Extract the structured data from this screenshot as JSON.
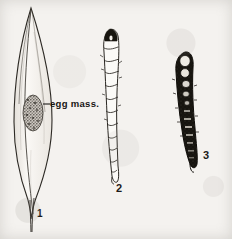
{
  "plate": {
    "background_color": "#f4f2ef",
    "ink_color": "#1d1b19",
    "type": "scientific-line-illustration",
    "caption_labels": {
      "figure_1": "1",
      "figure_2": "2",
      "figure_3": "3"
    },
    "annotations": {
      "egg_mass_label": "egg mass."
    },
    "figures": [
      {
        "number": "1",
        "subject": "leaf-blade-with-egg-mass",
        "description": "Narrow lanceolate leaf blade drawn in outline with midrib, bearing a stippled oval egg mass near mid-blade",
        "annotation": "egg mass.",
        "shading": "outline-with-stipple"
      },
      {
        "number": "2",
        "subject": "pale-segmented-larva",
        "description": "Elongate segmented larva in outline with dark triangular head capsule at top and tapering abdomen",
        "annotation": "",
        "shading": "outline-light"
      },
      {
        "number": "3",
        "subject": "dark-segmented-larva",
        "description": "Elongate dark-bodied larva with pale oval dorsal markings along the anterior segments",
        "annotation": "",
        "shading": "solid-dark-with-light-spots"
      }
    ]
  }
}
